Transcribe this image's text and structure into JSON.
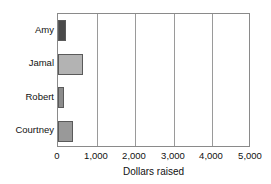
{
  "chart_data": {
    "type": "bar",
    "orientation": "horizontal",
    "title": "",
    "subtitle": "",
    "xlabel": "Dollars raised",
    "ylabel": "",
    "categories": [
      "Amy",
      "Jamal",
      "Robert",
      "Courtney"
    ],
    "values": [
      200,
      640,
      150,
      380
    ],
    "series": [
      {
        "name": "Dollars raised",
        "values": [
          200,
          640,
          150,
          380
        ]
      }
    ],
    "xlim": [
      0,
      5000
    ],
    "xticks": [
      0,
      1000,
      2000,
      3000,
      4000,
      5000
    ],
    "xtick_labels": [
      "0",
      "1,000",
      "2,000",
      "3,000",
      "4,000",
      "5,000"
    ],
    "grid": "vertical",
    "legend": "none",
    "bar_colors": [
      "#4a4a4a",
      "#b3b3b3",
      "#8c8c8c",
      "#999999"
    ],
    "bar_edge_color": "#5a5a5a",
    "frame_color": "#8a8a8a",
    "gridline_color": "#9a9a9a",
    "background_color": "#ffffff",
    "text_color": "#111111",
    "bars": [
      {
        "category": "Amy",
        "value": 200,
        "color": "#4a4a4a"
      },
      {
        "category": "Jamal",
        "value": 640,
        "color": "#b3b3b3"
      },
      {
        "category": "Robert",
        "value": 150,
        "color": "#8c8c8c"
      },
      {
        "category": "Courtney",
        "value": 380,
        "color": "#999999"
      }
    ]
  }
}
